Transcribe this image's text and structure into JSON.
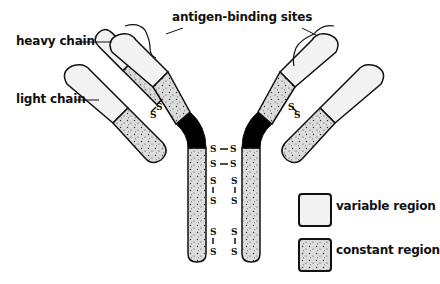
{
  "labels": {
    "antigen_binding_sites": "antigen-binding sites",
    "heavy_chain": "heavy chain",
    "light_chain": "light chain"
  },
  "bond_label": "S",
  "legend": [
    {
      "label": "variable region",
      "pattern": "plain",
      "color": "#f2f2f2"
    },
    {
      "label": "constant region",
      "pattern": "stippled",
      "color": "#dcdcdc"
    }
  ],
  "colors": {
    "outline": "#111111",
    "hinge": "#000000",
    "variable": "#f2f2f2",
    "constant": "#dcdcdc"
  }
}
